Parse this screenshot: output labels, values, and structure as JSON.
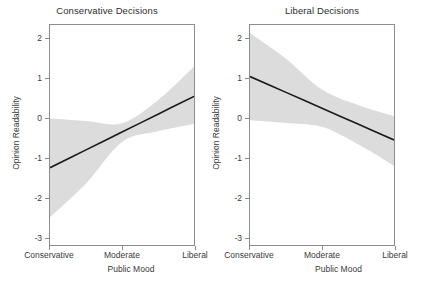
{
  "chart_data": [
    {
      "type": "area",
      "title": "Conservative Decisions",
      "xlabel": "Public Mood",
      "ylabel": "Opinion Readability",
      "xtick_labels": [
        "Conservative",
        "Moderate",
        "Liberal"
      ],
      "xtick_positions": [
        0,
        0.5,
        1
      ],
      "ytick_labels": [
        "2",
        "1",
        "0",
        "-1",
        "-2",
        "-3"
      ],
      "ytick_values": [
        2,
        1,
        0,
        -1,
        -2,
        -3
      ],
      "ylim": [
        -3.2,
        2.35
      ],
      "xlim": [
        0,
        1
      ],
      "grid": false,
      "legend": "none",
      "series": [
        {
          "name": "Fitted line",
          "x": [
            0,
            0.25,
            0.5,
            0.75,
            1
          ],
          "values": [
            -1.25,
            -0.8,
            -0.35,
            0.1,
            0.55
          ]
        },
        {
          "name": "Confidence band upper",
          "x": [
            0,
            0.25,
            0.5,
            0.75,
            1
          ],
          "values": [
            0.0,
            -0.07,
            -0.13,
            0.45,
            1.3
          ]
        },
        {
          "name": "Confidence band lower",
          "x": [
            0,
            0.25,
            0.5,
            0.75,
            1
          ],
          "values": [
            -2.5,
            -1.65,
            -0.6,
            -0.33,
            -0.15
          ]
        }
      ]
    },
    {
      "type": "area",
      "title": "Liberal Decisions",
      "xlabel": "Public Mood",
      "ylabel": "Opinion Readability",
      "xtick_labels": [
        "Conservative",
        "Moderate",
        "Liberal"
      ],
      "xtick_positions": [
        0,
        0.5,
        1
      ],
      "ytick_labels": [
        "2",
        "1",
        "0",
        "-1",
        "-2",
        "-3"
      ],
      "ytick_values": [
        2,
        1,
        0,
        -1,
        -2,
        -3
      ],
      "ylim": [
        -3.2,
        2.35
      ],
      "xlim": [
        0,
        1
      ],
      "grid": false,
      "legend": "none",
      "series": [
        {
          "name": "Fitted line",
          "x": [
            0,
            0.25,
            0.5,
            0.75,
            1
          ],
          "values": [
            1.05,
            0.65,
            0.25,
            -0.15,
            -0.55
          ]
        },
        {
          "name": "Confidence band upper",
          "x": [
            0,
            0.25,
            0.5,
            0.75,
            1
          ],
          "values": [
            2.15,
            1.5,
            0.72,
            0.33,
            0.05
          ]
        },
        {
          "name": "Confidence band lower",
          "x": [
            0,
            0.25,
            0.5,
            0.75,
            1
          ],
          "values": [
            -0.05,
            -0.12,
            -0.22,
            -0.66,
            -1.2
          ]
        }
      ]
    }
  ],
  "colors": {
    "band": "#dcdcdc",
    "line": "#1a1a1a",
    "frame": "#8d8d8d",
    "text": "#3a3a3a",
    "background": "#ffffff"
  },
  "panels": [
    {
      "title": "Conservative Decisions",
      "xlabel": "Public Mood",
      "ylabel": "Opinion Readability",
      "yticks": [
        "2",
        "1",
        "0",
        "-1",
        "-2",
        "-3"
      ],
      "xticks": [
        "Conservative",
        "Moderate",
        "Liberal"
      ]
    },
    {
      "title": "Liberal Decisions",
      "xlabel": "Public Mood",
      "ylabel": "Opinion Readability",
      "yticks": [
        "2",
        "1",
        "0",
        "-1",
        "-2",
        "-3"
      ],
      "xticks": [
        "Conservative",
        "Moderate",
        "Liberal"
      ]
    }
  ]
}
